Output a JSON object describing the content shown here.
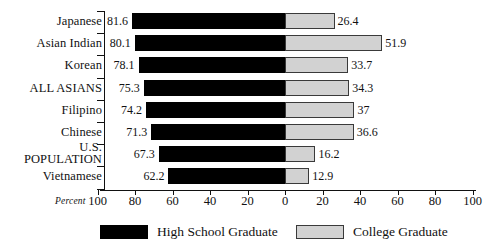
{
  "chart_data": {
    "type": "bar",
    "orientation": "horizontal",
    "layout": "diverging",
    "title": "",
    "xlabel": "Percent",
    "ylabel": "",
    "xlim": [
      -100,
      100
    ],
    "xticks_display": [
      "100",
      "80",
      "60",
      "40",
      "20",
      "0",
      "20",
      "40",
      "60",
      "80",
      "100"
    ],
    "xtick_values": [
      -100,
      -80,
      -60,
      -40,
      -20,
      0,
      20,
      40,
      60,
      80,
      100
    ],
    "grid": false,
    "legend_position": "bottom",
    "categories": [
      "Japanese",
      "Asian Indian",
      "Korean",
      "ALL ASIANS",
      "Filipino",
      "Chinese",
      "U.S.\nPOPULATION",
      "Vietnamese"
    ],
    "series": [
      {
        "name": "High School Graduate",
        "direction": "left",
        "color": "#000000",
        "values": [
          81.6,
          80.1,
          78.1,
          75.3,
          74.2,
          71.3,
          67.3,
          62.2
        ],
        "labels": [
          "81.6",
          "80.1",
          "78.1",
          "75.3",
          "74.2",
          "71.3",
          "67.3",
          "62.2"
        ]
      },
      {
        "name": "College Graduate",
        "direction": "right",
        "color": "#d2d2d2",
        "values": [
          26.4,
          51.9,
          33.7,
          34.3,
          37,
          36.6,
          16.2,
          12.9
        ],
        "labels": [
          "26.4",
          "51.9",
          "33.7",
          "34.3",
          "37",
          "36.6",
          "16.2",
          "12.9"
        ]
      }
    ]
  },
  "axis": {
    "percent_label": "Percent"
  },
  "legend": {
    "items": [
      {
        "label": "High School Graduate",
        "swatch": "black-swatch"
      },
      {
        "label": "College Graduate",
        "swatch": "gray-swatch"
      }
    ]
  },
  "colors": {
    "high_school": "#000000",
    "college": "#d2d2d2",
    "axis": "#111111",
    "background": "#ffffff"
  }
}
